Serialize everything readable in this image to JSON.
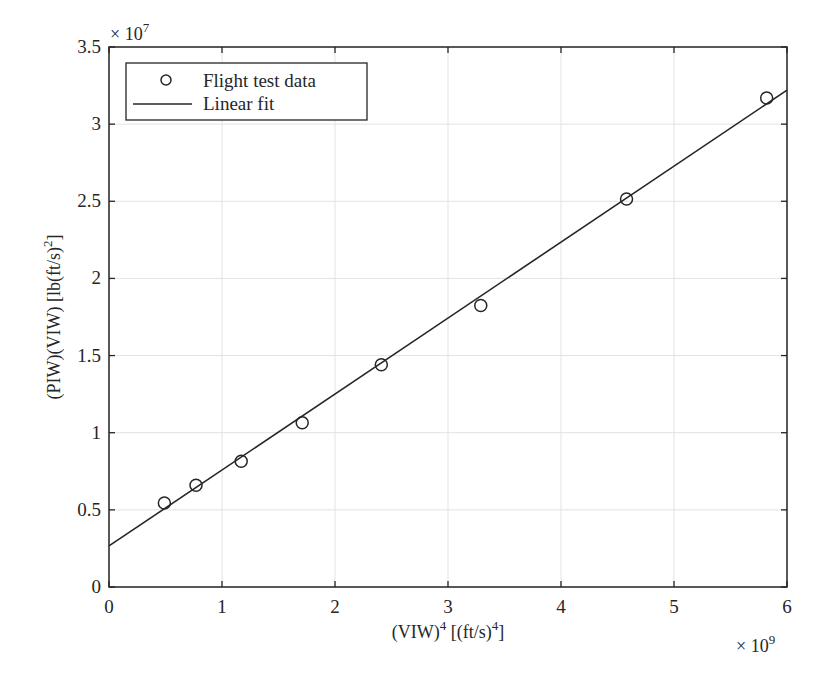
{
  "chart_data": {
    "type": "scatter",
    "title": "",
    "xlabel": "(VIW)^4 [(ft/s)^4]",
    "ylabel": "(PIW)(VIW) [lb(ft/s)^2]",
    "x_multiplier": "× 10^9",
    "y_multiplier": "× 10^7",
    "xlim": [
      0,
      6
    ],
    "ylim": [
      0,
      3.5
    ],
    "xticks": [
      "0",
      "1",
      "2",
      "3",
      "4",
      "5",
      "6"
    ],
    "yticks": [
      "0",
      "0.5",
      "1",
      "1.5",
      "2",
      "2.5",
      "3",
      "3.5"
    ],
    "grid": true,
    "legend_position": "upper left",
    "series": [
      {
        "name": "Flight test data",
        "kind": "markers",
        "marker": "circle",
        "x": [
          0.49,
          0.77,
          1.17,
          1.71,
          2.41,
          3.29,
          4.58,
          5.82
        ],
        "y": [
          0.545,
          0.66,
          0.815,
          1.065,
          1.44,
          1.825,
          2.515,
          3.17
        ]
      },
      {
        "name": "Linear fit",
        "kind": "line",
        "x": [
          0,
          6
        ],
        "y": [
          0.266,
          3.22
        ]
      }
    ]
  },
  "labels": {
    "xlabel_main": "(VIW)",
    "xlabel_sup1": "4",
    "xlabel_mid": " [(ft/s)",
    "xlabel_sup2": "4",
    "xlabel_end": "]",
    "ylabel_main": "(PIW)(VIW) [lb(ft/s)",
    "ylabel_sup": "2",
    "ylabel_end": "]",
    "x_exp_base": "× 10",
    "x_exp_power": "9",
    "y_exp_base": "× 10",
    "y_exp_power": "7"
  },
  "legend": {
    "items": [
      {
        "label": "Flight test data"
      },
      {
        "label": "Linear fit"
      }
    ]
  }
}
